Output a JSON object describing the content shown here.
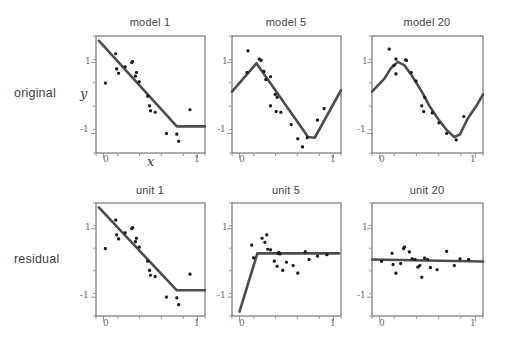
{
  "figure": {
    "row_labels": [
      {
        "id": "original",
        "text": "original"
      },
      {
        "id": "residual",
        "text": "residual"
      }
    ],
    "axis_labels": {
      "x": "x",
      "y": "y"
    },
    "tick_labels": {
      "x": [
        "0",
        "1"
      ],
      "y_top": "1",
      "y_bottom": "-1"
    }
  },
  "chart_data": [
    {
      "type": "scatter",
      "panel_id": "model-1",
      "row": "original",
      "title": "model 1",
      "xlabel": "x",
      "ylabel": "y",
      "xlim": [
        -0.08,
        1.08
      ],
      "ylim": [
        -1.55,
        1.75
      ],
      "xticks": [
        0,
        1
      ],
      "yticks": [
        -1,
        1
      ],
      "grid": false,
      "legend": "none",
      "points": [
        [
          0.02,
          0.42
        ],
        [
          0.13,
          1.25
        ],
        [
          0.14,
          0.82
        ],
        [
          0.16,
          0.7
        ],
        [
          0.23,
          0.88
        ],
        [
          0.3,
          1.0
        ],
        [
          0.31,
          1.03
        ],
        [
          0.34,
          0.62
        ],
        [
          0.35,
          0.72
        ],
        [
          0.38,
          0.46
        ],
        [
          0.47,
          0.05
        ],
        [
          0.49,
          -0.22
        ],
        [
          0.5,
          -0.36
        ],
        [
          0.55,
          -0.4
        ],
        [
          0.67,
          -1.0
        ],
        [
          0.78,
          -1.02
        ],
        [
          0.8,
          -1.22
        ],
        [
          0.92,
          -0.33
        ]
      ],
      "fit": {
        "name": "model 1 fit",
        "kind": "piecewise-linear",
        "vertices": [
          [
            -0.05,
            1.62
          ],
          [
            0.78,
            -0.8
          ],
          [
            1.08,
            -0.8
          ]
        ]
      }
    },
    {
      "type": "scatter",
      "panel_id": "model-5",
      "row": "original",
      "title": "model 5",
      "xlabel": "x",
      "ylabel": "y",
      "xlim": [
        -0.08,
        1.08
      ],
      "ylim": [
        -1.55,
        1.75
      ],
      "xticks": [
        0,
        1
      ],
      "yticks": [
        -1,
        1
      ],
      "grid": false,
      "legend": "none",
      "points": [
        [
          0.09,
          1.33
        ],
        [
          0.08,
          0.72
        ],
        [
          0.21,
          1.1
        ],
        [
          0.23,
          1.06
        ],
        [
          0.26,
          0.75
        ],
        [
          0.28,
          0.52
        ],
        [
          0.33,
          0.6
        ],
        [
          0.38,
          0.1
        ],
        [
          0.4,
          0.02
        ],
        [
          0.33,
          -0.22
        ],
        [
          0.39,
          -0.38
        ],
        [
          0.44,
          -0.4
        ],
        [
          0.55,
          -0.75
        ],
        [
          0.62,
          -1.15
        ],
        [
          0.72,
          -1.12
        ],
        [
          0.67,
          -1.38
        ],
        [
          0.83,
          -0.62
        ],
        [
          0.9,
          -0.3
        ]
      ],
      "fit": {
        "name": "model 5 fit",
        "kind": "piecewise-linear",
        "vertices": [
          [
            -0.08,
            0.18
          ],
          [
            0.18,
            0.98
          ],
          [
            0.73,
            -1.1
          ],
          [
            0.8,
            -1.12
          ],
          [
            1.08,
            0.22
          ]
        ]
      }
    },
    {
      "type": "scatter",
      "panel_id": "model-20",
      "row": "original",
      "title": "model 20",
      "xlabel": "x",
      "ylabel": "y",
      "xlim": [
        -0.08,
        1.08
      ],
      "ylim": [
        -1.55,
        1.75
      ],
      "xticks": [
        0,
        1
      ],
      "yticks": [
        -1,
        1
      ],
      "grid": false,
      "legend": "none",
      "points": [
        [
          0.1,
          1.38
        ],
        [
          0.17,
          1.1
        ],
        [
          0.15,
          0.92
        ],
        [
          0.17,
          0.68
        ],
        [
          0.27,
          1.08
        ],
        [
          0.28,
          1.06
        ],
        [
          0.33,
          0.72
        ],
        [
          0.38,
          0.48
        ],
        [
          0.47,
          0.02
        ],
        [
          0.44,
          -0.22
        ],
        [
          0.46,
          -0.38
        ],
        [
          0.55,
          -0.42
        ],
        [
          0.62,
          -0.7
        ],
        [
          0.7,
          -1.0
        ],
        [
          0.8,
          -1.18
        ],
        [
          0.88,
          -0.52
        ]
      ],
      "fit": {
        "name": "model 20 fit",
        "kind": "smooth",
        "vertices": [
          [
            -0.08,
            0.18
          ],
          [
            0.05,
            0.55
          ],
          [
            0.12,
            0.85
          ],
          [
            0.19,
            1.02
          ],
          [
            0.26,
            0.92
          ],
          [
            0.34,
            0.62
          ],
          [
            0.44,
            0.18
          ],
          [
            0.52,
            -0.22
          ],
          [
            0.6,
            -0.55
          ],
          [
            0.7,
            -0.9
          ],
          [
            0.78,
            -1.1
          ],
          [
            0.84,
            -1.02
          ],
          [
            0.92,
            -0.58
          ],
          [
            1.02,
            -0.18
          ],
          [
            1.08,
            0.1
          ]
        ]
      }
    },
    {
      "type": "scatter",
      "panel_id": "unit-1",
      "row": "residual",
      "title": "unit 1",
      "xlabel": "x",
      "ylabel": "y",
      "xlim": [
        -0.08,
        1.08
      ],
      "ylim": [
        -1.55,
        1.75
      ],
      "xticks": [
        0,
        1
      ],
      "yticks": [
        -1,
        1
      ],
      "grid": false,
      "legend": "none",
      "points": [
        [
          0.02,
          0.42
        ],
        [
          0.13,
          1.25
        ],
        [
          0.14,
          0.82
        ],
        [
          0.16,
          0.7
        ],
        [
          0.23,
          0.88
        ],
        [
          0.3,
          1.0
        ],
        [
          0.31,
          1.03
        ],
        [
          0.34,
          0.62
        ],
        [
          0.35,
          0.72
        ],
        [
          0.38,
          0.46
        ],
        [
          0.47,
          0.05
        ],
        [
          0.49,
          -0.22
        ],
        [
          0.5,
          -0.36
        ],
        [
          0.55,
          -0.4
        ],
        [
          0.67,
          -1.0
        ],
        [
          0.78,
          -1.02
        ],
        [
          0.8,
          -1.22
        ],
        [
          0.92,
          -0.33
        ]
      ],
      "fit": {
        "name": "unit 1 fit",
        "kind": "piecewise-linear",
        "vertices": [
          [
            -0.05,
            1.62
          ],
          [
            0.78,
            -0.8
          ],
          [
            1.08,
            -0.8
          ]
        ]
      }
    },
    {
      "type": "scatter",
      "panel_id": "unit-5",
      "row": "residual",
      "title": "unit 5",
      "xlabel": "x",
      "ylabel": "y",
      "xlim": [
        -0.08,
        1.08
      ],
      "ylim": [
        -1.55,
        1.75
      ],
      "xticks": [
        0,
        1
      ],
      "yticks": [
        -1,
        1
      ],
      "grid": false,
      "legend": "none",
      "points": [
        [
          0.13,
          0.52
        ],
        [
          0.15,
          0.15
        ],
        [
          0.24,
          0.72
        ],
        [
          0.27,
          0.6
        ],
        [
          0.29,
          0.82
        ],
        [
          0.3,
          0.4
        ],
        [
          0.33,
          0.38
        ],
        [
          0.37,
          0.05
        ],
        [
          0.41,
          0.28
        ],
        [
          0.42,
          0.3
        ],
        [
          0.43,
          0.26
        ],
        [
          0.4,
          -0.1
        ],
        [
          0.46,
          -0.22
        ],
        [
          0.5,
          0.02
        ],
        [
          0.57,
          -0.08
        ],
        [
          0.62,
          -0.3
        ],
        [
          0.7,
          0.32
        ],
        [
          0.74,
          0.1
        ],
        [
          0.83,
          0.2
        ],
        [
          0.93,
          0.24
        ]
      ],
      "fit": {
        "name": "unit 5 fit",
        "kind": "piecewise-linear",
        "vertices": [
          [
            0.0,
            -1.42
          ],
          [
            0.19,
            0.28
          ],
          [
            1.06,
            0.28
          ]
        ]
      }
    },
    {
      "type": "scatter",
      "panel_id": "unit-20",
      "row": "residual",
      "title": "unit 20",
      "xlabel": "x",
      "ylabel": "y",
      "xlim": [
        -0.08,
        1.08
      ],
      "ylim": [
        -1.55,
        1.75
      ],
      "xticks": [
        0,
        1
      ],
      "yticks": [
        -1,
        1
      ],
      "grid": false,
      "legend": "none",
      "points": [
        [
          0.02,
          0.05
        ],
        [
          0.13,
          0.28
        ],
        [
          0.14,
          -0.05
        ],
        [
          0.17,
          -0.3
        ],
        [
          0.22,
          -0.02
        ],
        [
          0.25,
          0.42
        ],
        [
          0.26,
          0.46
        ],
        [
          0.31,
          0.32
        ],
        [
          0.34,
          0.12
        ],
        [
          0.37,
          0.1
        ],
        [
          0.4,
          -0.12
        ],
        [
          0.42,
          -0.08
        ],
        [
          0.44,
          -0.42
        ],
        [
          0.47,
          0.14
        ],
        [
          0.5,
          0.1
        ],
        [
          0.53,
          -0.14
        ],
        [
          0.6,
          -0.2
        ],
        [
          0.7,
          0.34
        ],
        [
          0.78,
          -0.08
        ],
        [
          0.84,
          0.12
        ],
        [
          0.93,
          0.1
        ]
      ],
      "fit": {
        "name": "unit 20 fit",
        "kind": "linear",
        "vertices": [
          [
            -0.08,
            0.1
          ],
          [
            1.08,
            0.04
          ]
        ]
      }
    }
  ]
}
